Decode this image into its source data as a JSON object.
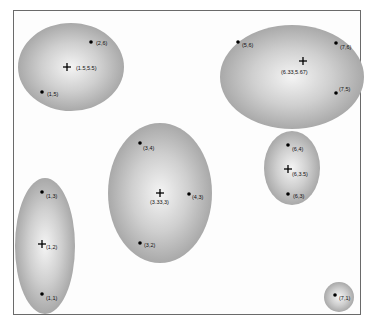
{
  "diagram": {
    "title": "",
    "clusters": [
      {
        "id": "c1",
        "centroid": {
          "label": "(1.5,5.5)"
        },
        "points": [
          {
            "label": "(2,6)"
          },
          {
            "label": "(1,5)"
          }
        ]
      },
      {
        "id": "c2",
        "centroid": {
          "label": "(6.33,5.67)"
        },
        "points": [
          {
            "label": "(5,6)"
          },
          {
            "label": "(7,6)"
          },
          {
            "label": "(7,5)"
          }
        ]
      },
      {
        "id": "c3",
        "centroid": {
          "label": "(3.33,3)"
        },
        "points": [
          {
            "label": "(3,4)"
          },
          {
            "label": "(4,3)"
          },
          {
            "label": "(3,2)"
          }
        ]
      },
      {
        "id": "c4",
        "centroid": {
          "label": "(6,3.5)"
        },
        "points": [
          {
            "label": "(6,4)"
          },
          {
            "label": "(6,3)"
          }
        ]
      },
      {
        "id": "c5",
        "centroid": {
          "label": "(1,2)"
        },
        "points": [
          {
            "label": "(1,3)"
          },
          {
            "label": "(1,1)"
          }
        ]
      },
      {
        "id": "c6",
        "centroid": null,
        "points": [
          {
            "label": "(7,1)"
          }
        ]
      }
    ]
  }
}
